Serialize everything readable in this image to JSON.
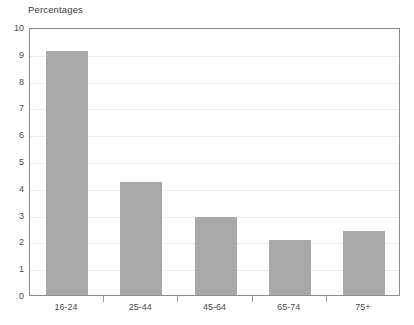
{
  "chart_data": {
    "type": "bar",
    "title": "Percentages",
    "subtitle": "",
    "xlabel": "",
    "ylabel": "",
    "categories": [
      "16-24",
      "25-44",
      "45-64",
      "65-74",
      "75+"
    ],
    "values": [
      9.1,
      4.2,
      2.9,
      2.05,
      2.4
    ],
    "series": [
      {
        "name": "Percentages",
        "values": [
          9.1,
          4.2,
          2.9,
          2.05,
          2.4
        ]
      }
    ],
    "ylim": [
      0,
      10
    ],
    "y_ticks": [
      0,
      1,
      2,
      3,
      4,
      5,
      6,
      7,
      8,
      9,
      10
    ],
    "y_tick_labels": [
      "0",
      "1",
      "2",
      "3",
      "4",
      "5",
      "6",
      "7",
      "8",
      "9",
      "10"
    ],
    "grid": true,
    "grid_axis": "y",
    "legend": false,
    "legend_position": "none",
    "annotations": [],
    "colors": {
      "bar_fill": "#a8a8a8",
      "plot_border": "#8c8c8c",
      "gridline": "#ececec",
      "tick_mark": "#9a9a9a",
      "text": "#4a4a4a",
      "title_text": "#3b3b3b",
      "background": "#ffffff"
    }
  }
}
